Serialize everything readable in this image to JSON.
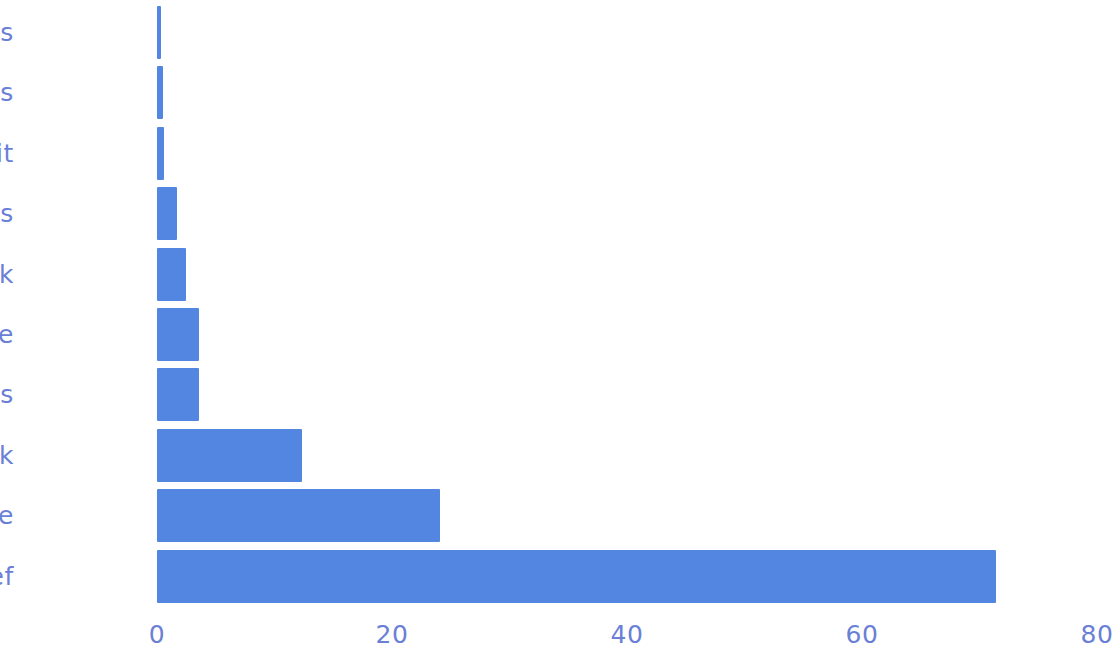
{
  "chart_data": {
    "type": "bar",
    "orientation": "horizontal",
    "title": "",
    "subtitle": "",
    "xlabel": "",
    "ylabel": "",
    "categories": [
      "Nuts",
      "Vegetables",
      "Fruit",
      "Legumes",
      "Milk",
      "Rice",
      "Grains",
      "Pork",
      "Cheese",
      "Beef"
    ],
    "values": [
      0.3,
      0.5,
      0.6,
      1.7,
      2.5,
      3.6,
      3.6,
      12.3,
      24.1,
      71.4
    ],
    "series": [
      {
        "name": "",
        "values": [
          0.3,
          0.5,
          0.6,
          1.7,
          2.5,
          3.6,
          3.6,
          12.3,
          24.1,
          71.4
        ]
      }
    ],
    "xlim": [
      0,
      80
    ],
    "xticks": [
      0,
      20,
      40,
      60,
      80
    ],
    "xtick_labels": [
      "0",
      "20",
      "40",
      "60",
      "80"
    ],
    "grid": false,
    "legend": null,
    "legend_position": "none",
    "annotations": [],
    "bar_color": "#5286e0",
    "text_color": "#6a7fd6",
    "background": "#ffffff",
    "style": "xkcd-handdrawn"
  },
  "axis": {
    "x_tick_labels": [
      "0",
      "20",
      "40",
      "60",
      "80"
    ]
  },
  "bars": [
    {
      "label": "Nuts",
      "value": 0.3
    },
    {
      "label": "Vegetables",
      "value": 0.5
    },
    {
      "label": "Fruit",
      "value": 0.6
    },
    {
      "label": "Legumes",
      "value": 1.7
    },
    {
      "label": "Milk",
      "value": 2.5
    },
    {
      "label": "Rice",
      "value": 3.6
    },
    {
      "label": "Grains",
      "value": 3.6
    },
    {
      "label": "Pork",
      "value": 12.3
    },
    {
      "label": "Cheese",
      "value": 24.1
    },
    {
      "label": "Beef",
      "value": 71.4
    }
  ]
}
